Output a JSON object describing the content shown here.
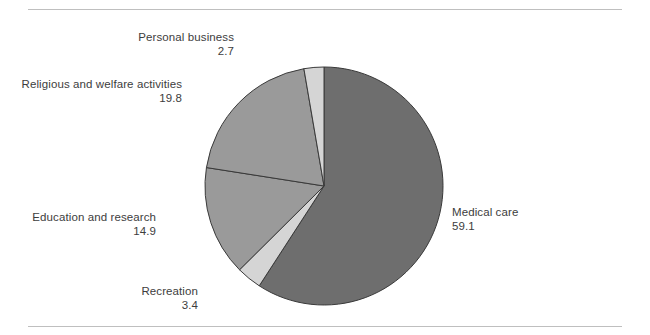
{
  "figure": {
    "background_color": "#ffffff",
    "rule_color": "#bfbfbf",
    "has_top_rule": true,
    "has_bottom_rule": true
  },
  "chart_data": {
    "type": "pie",
    "title": "",
    "subtitle": "",
    "xlabel": "",
    "ylabel": "",
    "legend_position": "none",
    "grid": false,
    "labels_show_values": true,
    "start_angle_deg": 0,
    "direction": "clockwise",
    "center": {
      "x": 324,
      "y": 186
    },
    "radius": 119,
    "total": 100.0,
    "categories": [
      "Medical care",
      "Recreation",
      "Education and research",
      "Religious and welfare activities",
      "Personal business"
    ],
    "values": [
      59.1,
      3.4,
      14.9,
      19.8,
      2.7
    ],
    "slices": [
      {
        "name": "Medical care",
        "value": 59.1,
        "value_text": "59.1",
        "color": "#6e6e6e",
        "label_align": "left"
      },
      {
        "name": "Recreation",
        "value": 3.4,
        "value_text": "3.4",
        "color": "#d5d5d5",
        "label_align": "right"
      },
      {
        "name": "Education and research",
        "value": 14.9,
        "value_text": "14.9",
        "color": "#9a9a9a",
        "label_align": "right"
      },
      {
        "name": "Religious and welfare activities",
        "value": 19.8,
        "value_text": "19.8",
        "color": "#9a9a9a",
        "label_align": "right"
      },
      {
        "name": "Personal business",
        "value": 2.7,
        "value_text": "2.7",
        "color": "#d5d5d5",
        "label_align": "right"
      }
    ],
    "slice_outline_color": "#3a3a3a",
    "slice_outline_width": 1
  }
}
